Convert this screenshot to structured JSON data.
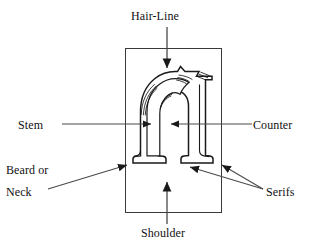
{
  "figure": {
    "background_color": "#ffffff",
    "stroke_color": "#1a1a1a",
    "fill_color": "#ffffff",
    "labels": {
      "hairline": "Hair-Line",
      "stem": "Stem",
      "counter": "Counter",
      "beard_line1": "Beard or",
      "beard_line2": "Neck",
      "serifs": "Serifs",
      "shoulder": "Shoulder"
    },
    "leader_lines": [
      {
        "name": "hairline-leader",
        "from": [
          167,
          27
        ],
        "to": [
          167,
          70
        ],
        "arrow": "down"
      },
      {
        "name": "stem-leader",
        "from": [
          62,
          124
        ],
        "to": [
          152,
          124
        ],
        "arrow": "right"
      },
      {
        "name": "counter-leader",
        "from": [
          252,
          124
        ],
        "to": [
          170,
          124
        ],
        "arrow": "left"
      },
      {
        "name": "beard-leader",
        "from": [
          48,
          188
        ],
        "to": [
          128,
          164
        ],
        "arrow": "up-right"
      },
      {
        "name": "serifs-leader-a",
        "from": [
          264,
          190
        ],
        "to": [
          189,
          166
        ],
        "arrow": "up-left"
      },
      {
        "name": "serifs-leader-b",
        "from": [
          264,
          190
        ],
        "to": [
          221,
          164
        ],
        "arrow": "up-left"
      },
      {
        "name": "shoulder-leader",
        "from": [
          167,
          222
        ],
        "to": [
          167,
          184
        ],
        "arrow": "up"
      }
    ],
    "bounding_box": {
      "x": 125,
      "y": 48,
      "width": 97,
      "height": 165
    }
  }
}
